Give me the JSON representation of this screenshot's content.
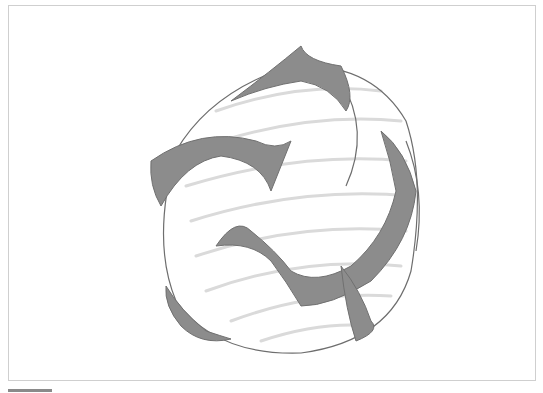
{
  "canvas": {
    "subject": "pencil sketch of a sphere with swirling dark shaded bands",
    "colors": {
      "background": "#ffffff",
      "frame_border": "#cfcfcf",
      "shade": "#8c8c8c",
      "stroke": "#6e6e6e",
      "hatch": "#dcdcdc",
      "scroll_indicator": "#8a8a8a"
    }
  }
}
